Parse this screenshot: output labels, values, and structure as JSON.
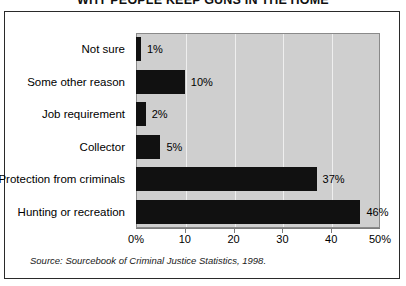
{
  "figure": {
    "title": "WHY PEOPLE KEEP GUNS IN THE HOME",
    "source_note": "Source: Sourcebook of Criminal Justice Statistics, 1998."
  },
  "colors": {
    "bar": "#111111",
    "plot_background": "#cfcfcf",
    "gridline": "#efefef",
    "axis": "#7d7d7d",
    "frame": "#2a2a2a",
    "text": "#000000"
  },
  "chart_data": {
    "type": "bar",
    "orientation": "horizontal",
    "title": "WHY PEOPLE KEEP GUNS IN THE HOME",
    "xlabel": "",
    "ylabel": "",
    "xlim": [
      0,
      50
    ],
    "grid": true,
    "legend": false,
    "categories": [
      "Not sure",
      "Some other reason",
      "Job requirement",
      "Collector",
      "Protection from criminals",
      "Hunting or recreation"
    ],
    "values": [
      1,
      10,
      2,
      5,
      37,
      46
    ],
    "data_labels": [
      "1%",
      "10%",
      "2%",
      "5%",
      "37%",
      "46%"
    ],
    "xticks": [
      0,
      10,
      20,
      30,
      40,
      50
    ],
    "xticklabels": [
      "0%",
      "10",
      "20",
      "30",
      "40",
      "50%"
    ]
  }
}
